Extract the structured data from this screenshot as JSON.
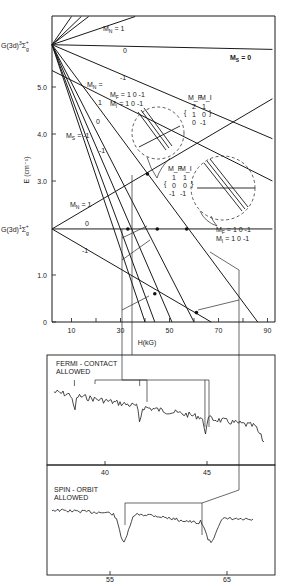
{
  "chart_data": [
    {
      "type": "line",
      "title": "",
      "xlabel": "H(kG)",
      "ylabel": "E (cm⁻¹)",
      "xlim": [
        2,
        92
      ],
      "ylim": [
        0,
        6.5
      ],
      "xticks": [
        10,
        30,
        50,
        70,
        90
      ],
      "xtick_minor": [
        20,
        40,
        60,
        80
      ],
      "yticks": [
        0,
        1.0,
        3.0,
        4.0,
        5.0
      ],
      "ytick_labels": [
        "0",
        "1.0",
        "3.0",
        "4.0",
        "5.0"
      ],
      "grid": false,
      "levels": [
        {
          "name": "G(3d)",
          "term": "3",
          "symbol": "Σ",
          "sub": "g",
          "sup": "+",
          "E0": 5.9
        },
        {
          "name": "G(3d)",
          "term": "1",
          "symbol": "Σ",
          "sub": "g",
          "sup": "+",
          "E0": 1.98
        }
      ],
      "series": [
        {
          "name": "triplet M_N=1 (steep a)",
          "x": [
            2,
            10
          ],
          "y": [
            5.9,
            6.5
          ]
        },
        {
          "name": "triplet M_N=1 (steep b)",
          "x": [
            2,
            14
          ],
          "y": [
            5.9,
            6.5
          ]
        },
        {
          "name": "triplet M_N=1 (steep c)",
          "x": [
            2,
            17
          ],
          "y": [
            5.9,
            6.5
          ]
        },
        {
          "name": "triplet M_N=1",
          "x": [
            2,
            36
          ],
          "y": [
            5.9,
            6.5
          ]
        },
        {
          "name": "triplet M_N=0",
          "x": [
            2,
            92
          ],
          "y": [
            5.9,
            5.8
          ]
        },
        {
          "name": "triplet M_N=-1",
          "x": [
            2,
            92
          ],
          "y": [
            5.9,
            3.9
          ]
        },
        {
          "name": "M_S=-1 M_N=1",
          "x": [
            2,
            60
          ],
          "y": [
            5.9,
            0
          ]
        },
        {
          "name": "M_S=-1 M_N=0",
          "x": [
            2,
            51
          ],
          "y": [
            5.9,
            0
          ]
        },
        {
          "name": "M_S=-1 M_N=-1",
          "x": [
            2,
            44
          ],
          "y": [
            5.9,
            0
          ]
        },
        {
          "name": "M_S=-1 M_N=-1 b",
          "x": [
            2,
            40
          ],
          "y": [
            5.9,
            0
          ]
        },
        {
          "name": "singlet M_N=1",
          "x": [
            2,
            92
          ],
          "y": [
            1.98,
            4.75
          ]
        },
        {
          "name": "singlet M_N=0",
          "x": [
            2,
            92
          ],
          "y": [
            1.98,
            1.98
          ]
        },
        {
          "name": "singlet M_N=-1",
          "x": [
            2,
            67
          ],
          "y": [
            1.98,
            0
          ]
        },
        {
          "name": "crossing line 1",
          "x": [
            2,
            86
          ],
          "y": [
            5.9,
            0
          ]
        },
        {
          "name": "crossing line 2",
          "x": [
            2,
            92
          ],
          "y": [
            5.35,
            3.0
          ]
        }
      ],
      "crossings": [
        {
          "H": 41,
          "E": 3.15
        },
        {
          "H": 33,
          "E": 1.98
        },
        {
          "H": 45,
          "E": 1.98
        },
        {
          "H": 57,
          "E": 1.98
        },
        {
          "H": 44,
          "E": 0.6
        },
        {
          "H": 61,
          "E": 0.2
        }
      ],
      "annotations": [
        {
          "text": "M_N = 1",
          "series": "triplet M_N=1"
        },
        {
          "text": "0",
          "series": "triplet M_N=0"
        },
        {
          "text": "-1",
          "series": "triplet M_N=-1"
        },
        {
          "text": "M_S = 0"
        },
        {
          "text": "M_N ="
        },
        {
          "text": "1"
        },
        {
          "text": "0"
        },
        {
          "text": "-1"
        },
        {
          "text": "M_S = -1"
        },
        {
          "text": "M_F = 1 0 -1"
        },
        {
          "text": "M_I = 1 0 -1"
        },
        {
          "text": "M_N = 1",
          "series": "singlet M_N=1"
        },
        {
          "text": "0",
          "series": "singlet M_N=0"
        },
        {
          "text": "-1",
          "series": "singlet M_N=-1"
        }
      ],
      "inset_upper": {
        "header": [
          "M_F",
          "M_I"
        ],
        "rows": [
          [
            "2",
            "1"
          ],
          [
            "1",
            "0"
          ],
          [
            "0",
            "-1"
          ]
        ]
      },
      "inset_lower": {
        "header": [
          "M_F",
          "M_I"
        ],
        "rows": [
          [
            "1",
            "1"
          ],
          [
            "0",
            "0"
          ],
          [
            "-1",
            "-1"
          ]
        ]
      },
      "right_labels": {
        "mf": "M_F = 1 0 -1",
        "mi": "M_I = 1 0 -1"
      }
    },
    {
      "type": "line",
      "title": "FERMI - CONTACT ALLOWED",
      "title_lines": [
        "FERMI - CONTACT",
        "ALLOWED"
      ],
      "xlabel": "",
      "xticks": [
        40,
        45
      ],
      "xlim": [
        35,
        48
      ],
      "dips_at": [
        38.5,
        41.7,
        44.9
      ],
      "trend": "decreasing noisy baseline with three sharp dips"
    },
    {
      "type": "line",
      "title": "SPIN - ORBIT ALLOWED",
      "title_lines": [
        "SPIN - ORBIT",
        "ALLOWED"
      ],
      "xlabel": "",
      "xticks": [
        55,
        65
      ],
      "xlim": [
        51,
        67
      ],
      "dips_at": [
        56.2,
        63.6
      ],
      "trend": "noisy baseline with two broad dips"
    }
  ],
  "labels": {
    "upper_level": {
      "prefix": "G(3d)",
      "term": "3",
      "sym": "Σ",
      "sub": "g",
      "sup": "+"
    },
    "lower_level": {
      "prefix": "G(3d)",
      "term": "1",
      "sym": "Σ",
      "sub": "g",
      "sup": "+"
    },
    "ms0": "M",
    "ms0_sub": "S",
    "ms0_val": " = 0",
    "ms_minus1": "M",
    "ms_minus1_sub": "S",
    "ms_minus1_val": " = -1",
    "mn_eq": "M",
    "mn_sub": "N",
    "mn_eq_val": " =",
    "mn1_val": " = 1",
    "zero": "0",
    "one": "1",
    "minus1": "-1",
    "mf": "M",
    "mf_sub": "F",
    "mi": "M",
    "mi_sub": "I",
    "mfmi_vals": " = 1 0 -1",
    "xaxis": "H(kG)",
    "yaxis": "E (cm⁻¹)"
  }
}
